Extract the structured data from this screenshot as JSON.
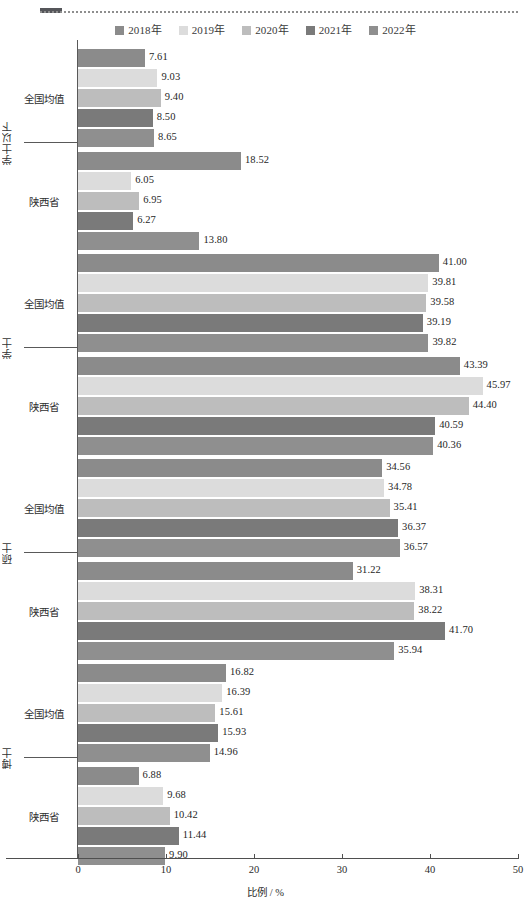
{
  "chart_data": {
    "type": "bar",
    "orientation": "horizontal",
    "title": "",
    "xlabel": "比例 / %",
    "ylabel": "",
    "xlim": [
      0,
      50
    ],
    "xticks": [
      0,
      10,
      20,
      30,
      40,
      50
    ],
    "grid": false,
    "legend_position": "top-center",
    "series": [
      {
        "name": "2018年",
        "color": "#8b8b8b"
      },
      {
        "name": "2019年",
        "color": "#dcdcdc"
      },
      {
        "name": "2020年",
        "color": "#bdbdbd"
      },
      {
        "name": "2021年",
        "color": "#7a7a7a"
      },
      {
        "name": "2022年",
        "color": "#8f8f8f"
      }
    ],
    "groups": [
      {
        "label": "学士以下",
        "subgroups": [
          {
            "label": "全国均值",
            "values": [
              7.61,
              9.03,
              9.4,
              8.5,
              8.65
            ]
          },
          {
            "label": "陕西省",
            "values": [
              18.52,
              6.05,
              6.95,
              6.27,
              13.8
            ]
          }
        ]
      },
      {
        "label": "学士",
        "subgroups": [
          {
            "label": "全国均值",
            "values": [
              41.0,
              39.81,
              39.58,
              39.19,
              39.82
            ]
          },
          {
            "label": "陕西省",
            "values": [
              43.39,
              45.97,
              44.4,
              40.59,
              40.36
            ]
          }
        ]
      },
      {
        "label": "硕士",
        "subgroups": [
          {
            "label": "全国均值",
            "values": [
              34.56,
              34.78,
              35.41,
              36.37,
              36.57
            ]
          },
          {
            "label": "陕西省",
            "values": [
              31.22,
              38.31,
              38.22,
              41.7,
              35.94
            ]
          }
        ]
      },
      {
        "label": "博士",
        "subgroups": [
          {
            "label": "全国均值",
            "values": [
              16.82,
              16.39,
              15.61,
              15.93,
              14.96
            ]
          },
          {
            "label": "陕西省",
            "values": [
              6.88,
              9.68,
              10.42,
              11.44,
              9.9
            ]
          }
        ]
      }
    ],
    "value_label_format": "0.00"
  }
}
